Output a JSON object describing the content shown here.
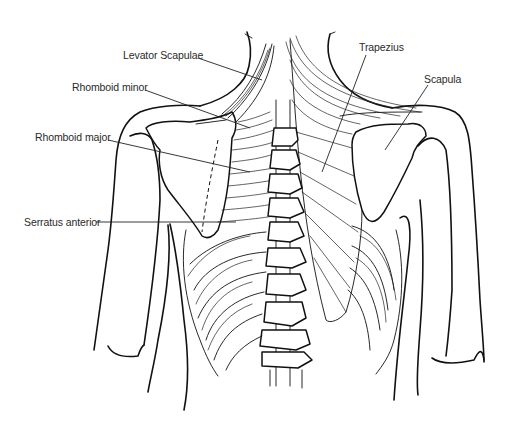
{
  "diagram": {
    "labels": [
      {
        "id": "levator-scapulae",
        "text": "Levator Scapulae",
        "x": 123,
        "y": 49,
        "leader": [
          198,
          58,
          262,
          80
        ]
      },
      {
        "id": "rhomboid-minor",
        "text": "Rhomboid minor",
        "x": 72,
        "y": 81,
        "leader": [
          145,
          90,
          250,
          128
        ]
      },
      {
        "id": "rhomboid-major",
        "text": "Rhomboid major",
        "x": 35,
        "y": 131,
        "leader": [
          108,
          140,
          250,
          172
        ]
      },
      {
        "id": "serratus-anterior",
        "text": "Serratus anterior",
        "x": 24,
        "y": 216,
        "leader": [
          96,
          222,
          236,
          222
        ]
      },
      {
        "id": "trapezius",
        "text": "Trapezius",
        "x": 359,
        "y": 41,
        "leader": [
          366,
          55,
          322,
          172
        ]
      },
      {
        "id": "scapula",
        "text": "Scapula",
        "x": 424,
        "y": 73,
        "leader": [
          428,
          85,
          385,
          150
        ]
      }
    ],
    "colors": {
      "line": "#111111",
      "text": "#2a2a2a",
      "background": "#ffffff"
    }
  }
}
